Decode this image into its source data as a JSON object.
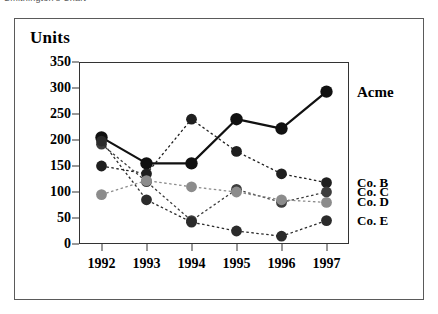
{
  "document": {
    "title": "Smithington's Chart"
  },
  "chart_data": {
    "type": "line",
    "title": "",
    "xlabel": "",
    "ylabel": "Units",
    "categories": [
      "1992",
      "1993",
      "1994",
      "1995",
      "1996",
      "1997"
    ],
    "ylim": [
      0,
      350
    ],
    "yticks": [
      "0",
      "50",
      "100",
      "150",
      "200",
      "250",
      "300",
      "350"
    ],
    "ytick_values": [
      0,
      50,
      100,
      150,
      200,
      250,
      300,
      350
    ],
    "grid": false,
    "legend_position": "right",
    "series": [
      {
        "name": "Acme",
        "values": [
          205,
          155,
          155,
          240,
          222,
          293
        ],
        "color": "#111111",
        "line_style": "solid",
        "line_width": 2.2,
        "marker_size": 6.2
      },
      {
        "name": "Co. B",
        "values": [
          150,
          135,
          240,
          178,
          135,
          118
        ],
        "color": "#1f1f1f",
        "line_style": "dotted",
        "line_width": 1.3,
        "marker_size": 5.4
      },
      {
        "name": "Co. C",
        "values": [
          192,
          120,
          45,
          105,
          80,
          100
        ],
        "color": "#3d3d3d",
        "line_style": "dotted",
        "line_width": 1.3,
        "marker_size": 5.4
      },
      {
        "name": "Co. D",
        "values": [
          95,
          122,
          110,
          100,
          85,
          80
        ],
        "color": "#8c8c8c",
        "line_style": "dotted",
        "line_width": 1.3,
        "marker_size": 5.4
      },
      {
        "name": "Co. E",
        "values": [
          198,
          85,
          42,
          25,
          15,
          45
        ],
        "color": "#2b2b2b",
        "line_style": "dotted",
        "line_width": 1.3,
        "marker_size": 5.4
      }
    ]
  }
}
